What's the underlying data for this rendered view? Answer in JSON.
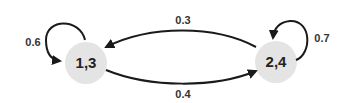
{
  "diagram": {
    "type": "markov-chain-state-diagram",
    "nodes": [
      {
        "id": "n13",
        "label": "1,3"
      },
      {
        "id": "n24",
        "label": "2,4"
      }
    ],
    "edges": [
      {
        "from": "1,3",
        "to": "1,3",
        "label": "0.6"
      },
      {
        "from": "2,4",
        "to": "1,3",
        "label": "0.3"
      },
      {
        "from": "1,3",
        "to": "2,4",
        "label": "0.4"
      },
      {
        "from": "2,4",
        "to": "2,4",
        "label": "0.7"
      }
    ],
    "colors": {
      "node_fill": "#e4e4e4",
      "edge_stroke": "#1a1a1a",
      "text": "#222222"
    }
  }
}
